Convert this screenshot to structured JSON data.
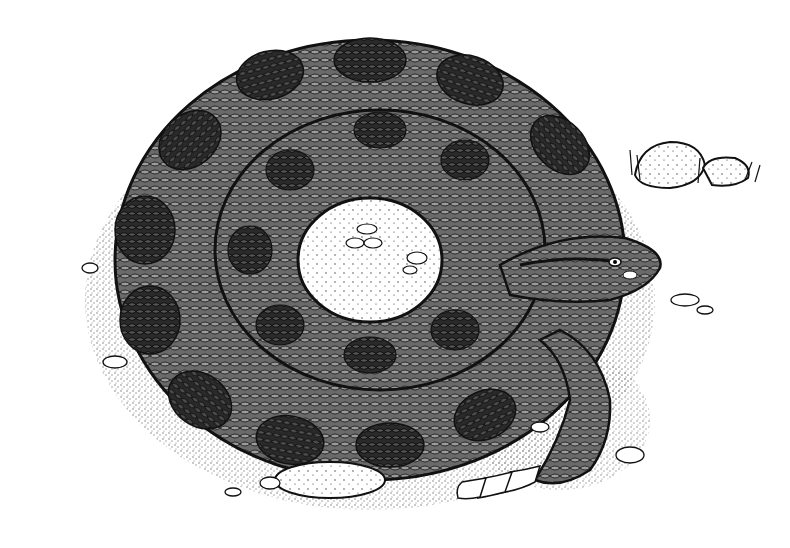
{
  "illustration": {
    "subject": "coiled rattlesnake",
    "style": "black ink stipple illustration",
    "alt": "Black-and-white stipple drawing of a coiled rattlesnake with its head resting on the coil and rattle tail extending to the lower right, surrounded by scattered pebbles and two rocks with grass tufts.",
    "colors": {
      "background": "#ffffff",
      "ink": "#111111",
      "mid_tone": "#555555",
      "light_tone": "#9a9a9a"
    },
    "elements": [
      {
        "name": "snake-body-coil",
        "description": "outer coil of snake body with dark diamond blotches"
      },
      {
        "name": "snake-inner-coil",
        "description": "inner coil ring surrounding light center"
      },
      {
        "name": "coil-center",
        "description": "light stippled ground visible in coil center with small pebbles"
      },
      {
        "name": "snake-head",
        "description": "head resting on coil, facing right"
      },
      {
        "name": "rattle-tail",
        "description": "segmented rattle extending to lower right"
      },
      {
        "name": "rocks",
        "description": "two rocks with grass tufts at upper right"
      },
      {
        "name": "pebbles",
        "description": "scattered pebbles around base of coil"
      }
    ]
  }
}
